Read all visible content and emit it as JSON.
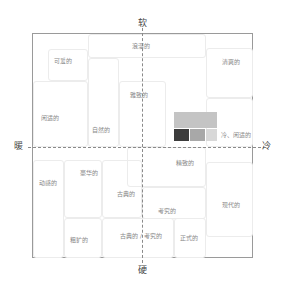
{
  "axes": {
    "top": "软",
    "bottom": "硬",
    "left": "暖",
    "right": "冷"
  },
  "regions": [
    {
      "id": "romantic",
      "label": "浪漫的"
    },
    {
      "id": "cute",
      "label": "可爱的"
    },
    {
      "id": "fresh",
      "label": "清爽的"
    },
    {
      "id": "elegant",
      "label": "雅致的"
    },
    {
      "id": "casual",
      "label": "闲适的"
    },
    {
      "id": "natural",
      "label": "自然的"
    },
    {
      "id": "cool-casual",
      "label": "冷、闲适的"
    },
    {
      "id": "chic",
      "label": "精致的"
    },
    {
      "id": "dynamic",
      "label": "动感的"
    },
    {
      "id": "gorgeous",
      "label": "豪华的"
    },
    {
      "id": "classic",
      "label": "古典的"
    },
    {
      "id": "dandy",
      "label": "考究的"
    },
    {
      "id": "modern",
      "label": "现代的"
    },
    {
      "id": "wild",
      "label": "粗犷的"
    },
    {
      "id": "classic-dandy",
      "label": "古典的 / 考究的"
    },
    {
      "id": "formal",
      "label": "正式的"
    }
  ],
  "swatches": {
    "top_bar": "#c4c4c4",
    "row": [
      "#3c3c3c",
      "#a8a8a8",
      "#d8d8d8"
    ]
  }
}
